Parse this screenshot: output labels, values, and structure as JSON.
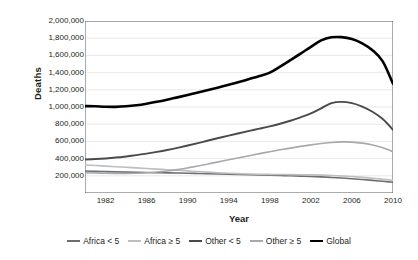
{
  "chart_data": {
    "type": "line",
    "title": "",
    "xlabel": "Year",
    "ylabel": "Deaths",
    "xlim": [
      1980,
      2010
    ],
    "ylim": [
      0,
      2000000
    ],
    "grid": true,
    "legend_position": "bottom",
    "x": [
      1980,
      1981,
      1982,
      1983,
      1984,
      1985,
      1986,
      1987,
      1988,
      1989,
      1990,
      1991,
      1992,
      1993,
      1994,
      1995,
      1996,
      1997,
      1998,
      1999,
      2000,
      2001,
      2002,
      2003,
      2004,
      2005,
      2006,
      2007,
      2008,
      2009,
      2010
    ],
    "xtick_labels": [
      "1982",
      "1986",
      "1990",
      "1994",
      "1998",
      "2002",
      "2006",
      "2010"
    ],
    "xtick_values": [
      1982,
      1986,
      1990,
      1994,
      1998,
      2002,
      2006,
      2010
    ],
    "ytick_labels": [
      "200,000",
      "400,000",
      "600,000",
      "800,000",
      "1,000,000",
      "1,200,000",
      "1,400,000",
      "1,600,000",
      "1,800,000",
      "2,000,000"
    ],
    "ytick_values": [
      200000,
      400000,
      600000,
      800000,
      1000000,
      1200000,
      1400000,
      1600000,
      1800000,
      2000000
    ],
    "series": [
      {
        "name": "Africa < 5",
        "color": "#6d6e71",
        "width": 1.6,
        "values": [
          255000,
          252000,
          249000,
          246000,
          243000,
          240000,
          238000,
          236000,
          234000,
          232000,
          230000,
          227000,
          224000,
          221000,
          218000,
          215000,
          212000,
          209000,
          206000,
          203000,
          200000,
          196000,
          192000,
          187000,
          181000,
          174000,
          166000,
          157000,
          147000,
          136000,
          125000
        ]
      },
      {
        "name": "Africa ≥ 5",
        "color": "#bcbec0",
        "width": 1.6,
        "values": [
          325000,
          320000,
          313000,
          306000,
          299000,
          292000,
          285000,
          278000,
          271000,
          264000,
          257000,
          250000,
          243000,
          236000,
          230000,
          225000,
          221000,
          218000,
          216000,
          215000,
          214000,
          213000,
          211000,
          208000,
          204000,
          198000,
          191000,
          182000,
          172000,
          160000,
          148000
        ]
      },
      {
        "name": "Other < 5",
        "color": "#4a4a4c",
        "width": 1.9,
        "values": [
          390000,
          395000,
          402000,
          412000,
          425000,
          440000,
          458000,
          478000,
          500000,
          525000,
          552000,
          580000,
          610000,
          640000,
          668000,
          695000,
          722000,
          748000,
          775000,
          805000,
          840000,
          880000,
          925000,
          985000,
          1045000,
          1060000,
          1045000,
          1005000,
          945000,
          860000,
          735000
        ]
      },
      {
        "name": "Other ≥ 5",
        "color": "#a7a9ac",
        "width": 1.6,
        "values": [
          235000,
          232000,
          229000,
          228000,
          228000,
          230000,
          235000,
          244000,
          256000,
          272000,
          292000,
          314000,
          338000,
          362000,
          386000,
          410000,
          434000,
          458000,
          480000,
          502000,
          522000,
          542000,
          560000,
          575000,
          588000,
          594000,
          592000,
          580000,
          558000,
          525000,
          480000
        ]
      },
      {
        "name": "Global",
        "color": "#000000",
        "width": 2.6,
        "values": [
          1010000,
          1008000,
          1003000,
          1002000,
          1008000,
          1020000,
          1038000,
          1060000,
          1085000,
          1112000,
          1140000,
          1168000,
          1198000,
          1228000,
          1258000,
          1290000,
          1325000,
          1360000,
          1400000,
          1470000,
          1545000,
          1620000,
          1700000,
          1775000,
          1810000,
          1812000,
          1790000,
          1740000,
          1660000,
          1530000,
          1270000
        ]
      }
    ]
  }
}
